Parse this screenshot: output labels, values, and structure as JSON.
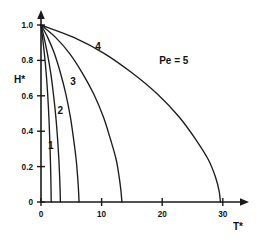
{
  "chart_data": {
    "type": "line",
    "title": "",
    "subtitle": "",
    "xlabel": "T*",
    "ylabel": "H*",
    "xlim": [
      0,
      33
    ],
    "ylim": [
      0,
      1.05
    ],
    "xticks": [
      0,
      10,
      20,
      30
    ],
    "xtick_labels": [
      "0",
      "10",
      "20",
      "30"
    ],
    "yticks": [
      0,
      0.2,
      0.4,
      0.6,
      0.8,
      1.0
    ],
    "ytick_labels": [
      "0",
      "0.2",
      "0.4",
      "0.6",
      "0.8",
      "1.0"
    ],
    "grid": false,
    "legend_position": "inline-annotations",
    "annotations": [
      {
        "text": "Pe = 5",
        "x": 19.5,
        "y": 0.78
      },
      {
        "text": "4",
        "x": 9.4,
        "y": 0.86
      },
      {
        "text": "3",
        "x": 5.3,
        "y": 0.66
      },
      {
        "text": "2",
        "x": 3.2,
        "y": 0.5
      },
      {
        "text": "1",
        "x": 1.6,
        "y": 0.3
      }
    ],
    "series": [
      {
        "name": "Pe = 1",
        "label": "1",
        "x": [
          0,
          0.25,
          0.55,
          0.85,
          1.1,
          1.3,
          1.45,
          1.55,
          1.62,
          1.66,
          1.68
        ],
        "y": [
          1.0,
          0.93,
          0.84,
          0.73,
          0.61,
          0.48,
          0.35,
          0.24,
          0.14,
          0.06,
          0.0
        ]
      },
      {
        "name": "Pe = 2",
        "label": "2",
        "x": [
          0,
          0.5,
          1.05,
          1.6,
          2.05,
          2.45,
          2.75,
          2.95,
          3.08,
          3.16,
          3.2
        ],
        "y": [
          1.0,
          0.93,
          0.84,
          0.73,
          0.61,
          0.48,
          0.35,
          0.24,
          0.14,
          0.06,
          0.0
        ]
      },
      {
        "name": "Pe = 3",
        "label": "3",
        "x": [
          0,
          1.1,
          2.2,
          3.2,
          4.1,
          4.85,
          5.4,
          5.8,
          6.05,
          6.2,
          6.28
        ],
        "y": [
          1.0,
          0.93,
          0.84,
          0.73,
          0.61,
          0.48,
          0.35,
          0.24,
          0.14,
          0.06,
          0.0
        ]
      },
      {
        "name": "Pe = 4",
        "label": "4",
        "x": [
          0,
          2.4,
          4.7,
          6.8,
          8.7,
          10.3,
          11.5,
          12.4,
          12.9,
          13.2,
          13.35
        ],
        "y": [
          1.0,
          0.93,
          0.84,
          0.73,
          0.61,
          0.48,
          0.35,
          0.24,
          0.14,
          0.06,
          0.0
        ]
      },
      {
        "name": "Pe = 5",
        "label": "Pe = 5",
        "x": [
          0,
          5.4,
          10.4,
          15.0,
          19.2,
          22.8,
          25.6,
          27.6,
          28.8,
          29.4,
          29.6
        ],
        "y": [
          1.0,
          0.93,
          0.84,
          0.73,
          0.61,
          0.48,
          0.35,
          0.24,
          0.14,
          0.06,
          0.0
        ]
      }
    ],
    "colors": {
      "curve": "#1c1c1c",
      "axis": "#1a1a1a",
      "text": "#111111",
      "background": "#ffffff"
    }
  }
}
